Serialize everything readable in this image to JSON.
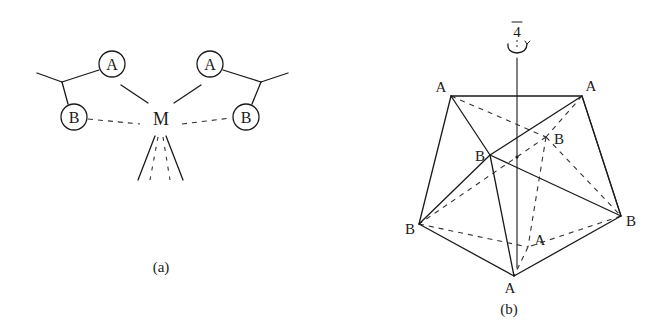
{
  "figure_a": {
    "caption": "(a)",
    "metal_label": "M",
    "left_ligand": {
      "atom_a": "A",
      "atom_b": "B"
    },
    "right_ligand": {
      "atom_a": "A",
      "atom_b": "B"
    }
  },
  "figure_b": {
    "caption": "(b)",
    "axis_symbol": "4",
    "axis_overline": true,
    "vertices": {
      "top_left": "A",
      "top_right": "A",
      "mid_front": "B",
      "mid_back": "B",
      "left": "B",
      "right": "B",
      "bottom": "A",
      "inner_back": "A"
    }
  },
  "colors": {
    "ink": "#1a1a1a",
    "background": "#ffffff"
  }
}
